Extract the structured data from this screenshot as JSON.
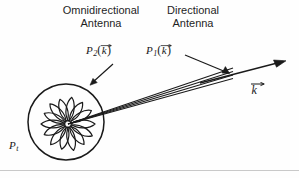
{
  "figure": {
    "width": 299,
    "height": 178,
    "background": "#fefefe",
    "stroke_color": "#1a1a1a",
    "headings": {
      "omnidirectional": "Omnidirectional\nAntenna",
      "omnidirectional_line1": "Omnidirectional",
      "omnidirectional_line2": "Antenna",
      "directional_line1": "Directional",
      "directional_line2": "Antenna"
    },
    "labels": {
      "p2_base": "P",
      "p2_sub": "2",
      "p1_base": "P",
      "p1_sub": "1",
      "pt_base": "P",
      "pt_sub": "t",
      "paren_open": "(",
      "paren_close": ")",
      "k_symbol": "k"
    },
    "annotations": {
      "p2_meaning": "Power radiated by omnidirectional antenna in direction k",
      "p1_meaning": "Power radiated by directional antenna in direction k",
      "pt_meaning": "Total transmitted power",
      "k_meaning": "Wave vector direction"
    },
    "shapes": {
      "circle_center_x": 66,
      "circle_center_y": 122,
      "circle_radius": 38,
      "pattern_center_x": 68,
      "pattern_center_y": 124,
      "pattern_lobe_count": 14,
      "beam_line_count": 4,
      "beam_tip_x": 286,
      "beam_tip_y": 62
    }
  }
}
